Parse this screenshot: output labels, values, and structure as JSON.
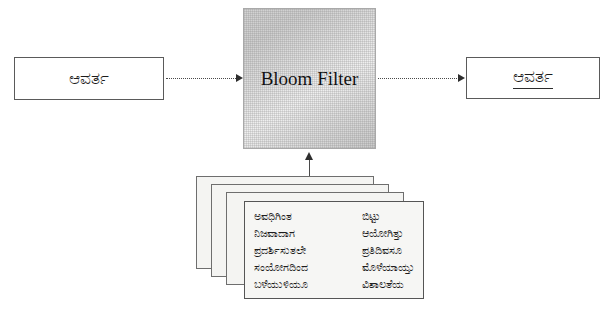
{
  "diagram": {
    "input": {
      "label": "ಆವರ್ತ",
      "name": "input-term-box"
    },
    "filter": {
      "label": "Bloom Filter"
    },
    "output": {
      "label": "ಆವರ್ತ",
      "underlined": true
    },
    "connectors": {
      "input_to_filter": "dotted-arrow-right",
      "filter_to_output": "dotted-arrow-right",
      "documents_to_filter": "solid-arrow-up"
    },
    "document_stack": {
      "card_count": 4,
      "front_card": {
        "left_column": [
          "ಅವಧಿಗಿಂತ",
          "ನಿಜವಾದಾಗ",
          "ಪ್ರದರ್ಶಿಸುತಲೇ",
          "ಸಂಯೋಗದಿಂದ",
          "ಬಳೆಯುಳಿಯೂ"
        ],
        "right_column": [
          "ಬಿಟ್ಟು",
          "ಆಯೋಗಿತ್ತು",
          "ಪ್ರತಿದಿವಸೂ",
          "ಮೊಳೆಯಾಯ್ತು",
          "ವಿಶಾಲತೆಯ"
        ]
      }
    },
    "colors": {
      "background": "#ffffff",
      "box_border": "#5a5a5a",
      "filter_fill": "#d9d9d9",
      "text": "#1b1b1b",
      "card_fill": "#f4f4f2"
    }
  }
}
